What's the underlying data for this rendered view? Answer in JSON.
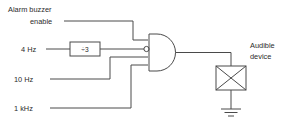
{
  "diagram": {
    "stroke_color": "#4a4a4a",
    "text_color": "#2b2b2b",
    "background_color": "#ffffff",
    "labels": {
      "enable_line1": "Alarm buzzer",
      "enable_line2": "enable",
      "input_4hz": "4 Hz",
      "input_10hz": "10 Hz",
      "input_1khz": "1 kHz",
      "divider_block": "÷3",
      "output_line1": "Audible",
      "output_line2": "device"
    },
    "components": [
      {
        "name": "divider-block",
        "type": "block",
        "label": "÷3"
      },
      {
        "name": "and-gate",
        "type": "and-gate",
        "inputs": 4,
        "inverted_inputs": [
          2
        ]
      },
      {
        "name": "audible-device",
        "type": "crossed-box"
      },
      {
        "name": "ground",
        "type": "ground"
      }
    ],
    "signals": [
      {
        "name": "alarm-buzzer-enable",
        "label": "Alarm buzzer enable",
        "target": "and-gate input 1"
      },
      {
        "name": "clock-4hz",
        "label": "4 Hz",
        "target": "divider-block"
      },
      {
        "name": "divided-4hz",
        "label": "÷3 output",
        "target": "and-gate input 2 (inverted)"
      },
      {
        "name": "clock-10hz",
        "label": "10 Hz",
        "target": "and-gate input 3"
      },
      {
        "name": "clock-1khz",
        "label": "1 kHz",
        "target": "and-gate input 4"
      },
      {
        "name": "gate-output",
        "label": "",
        "target": "audible-device"
      }
    ]
  }
}
